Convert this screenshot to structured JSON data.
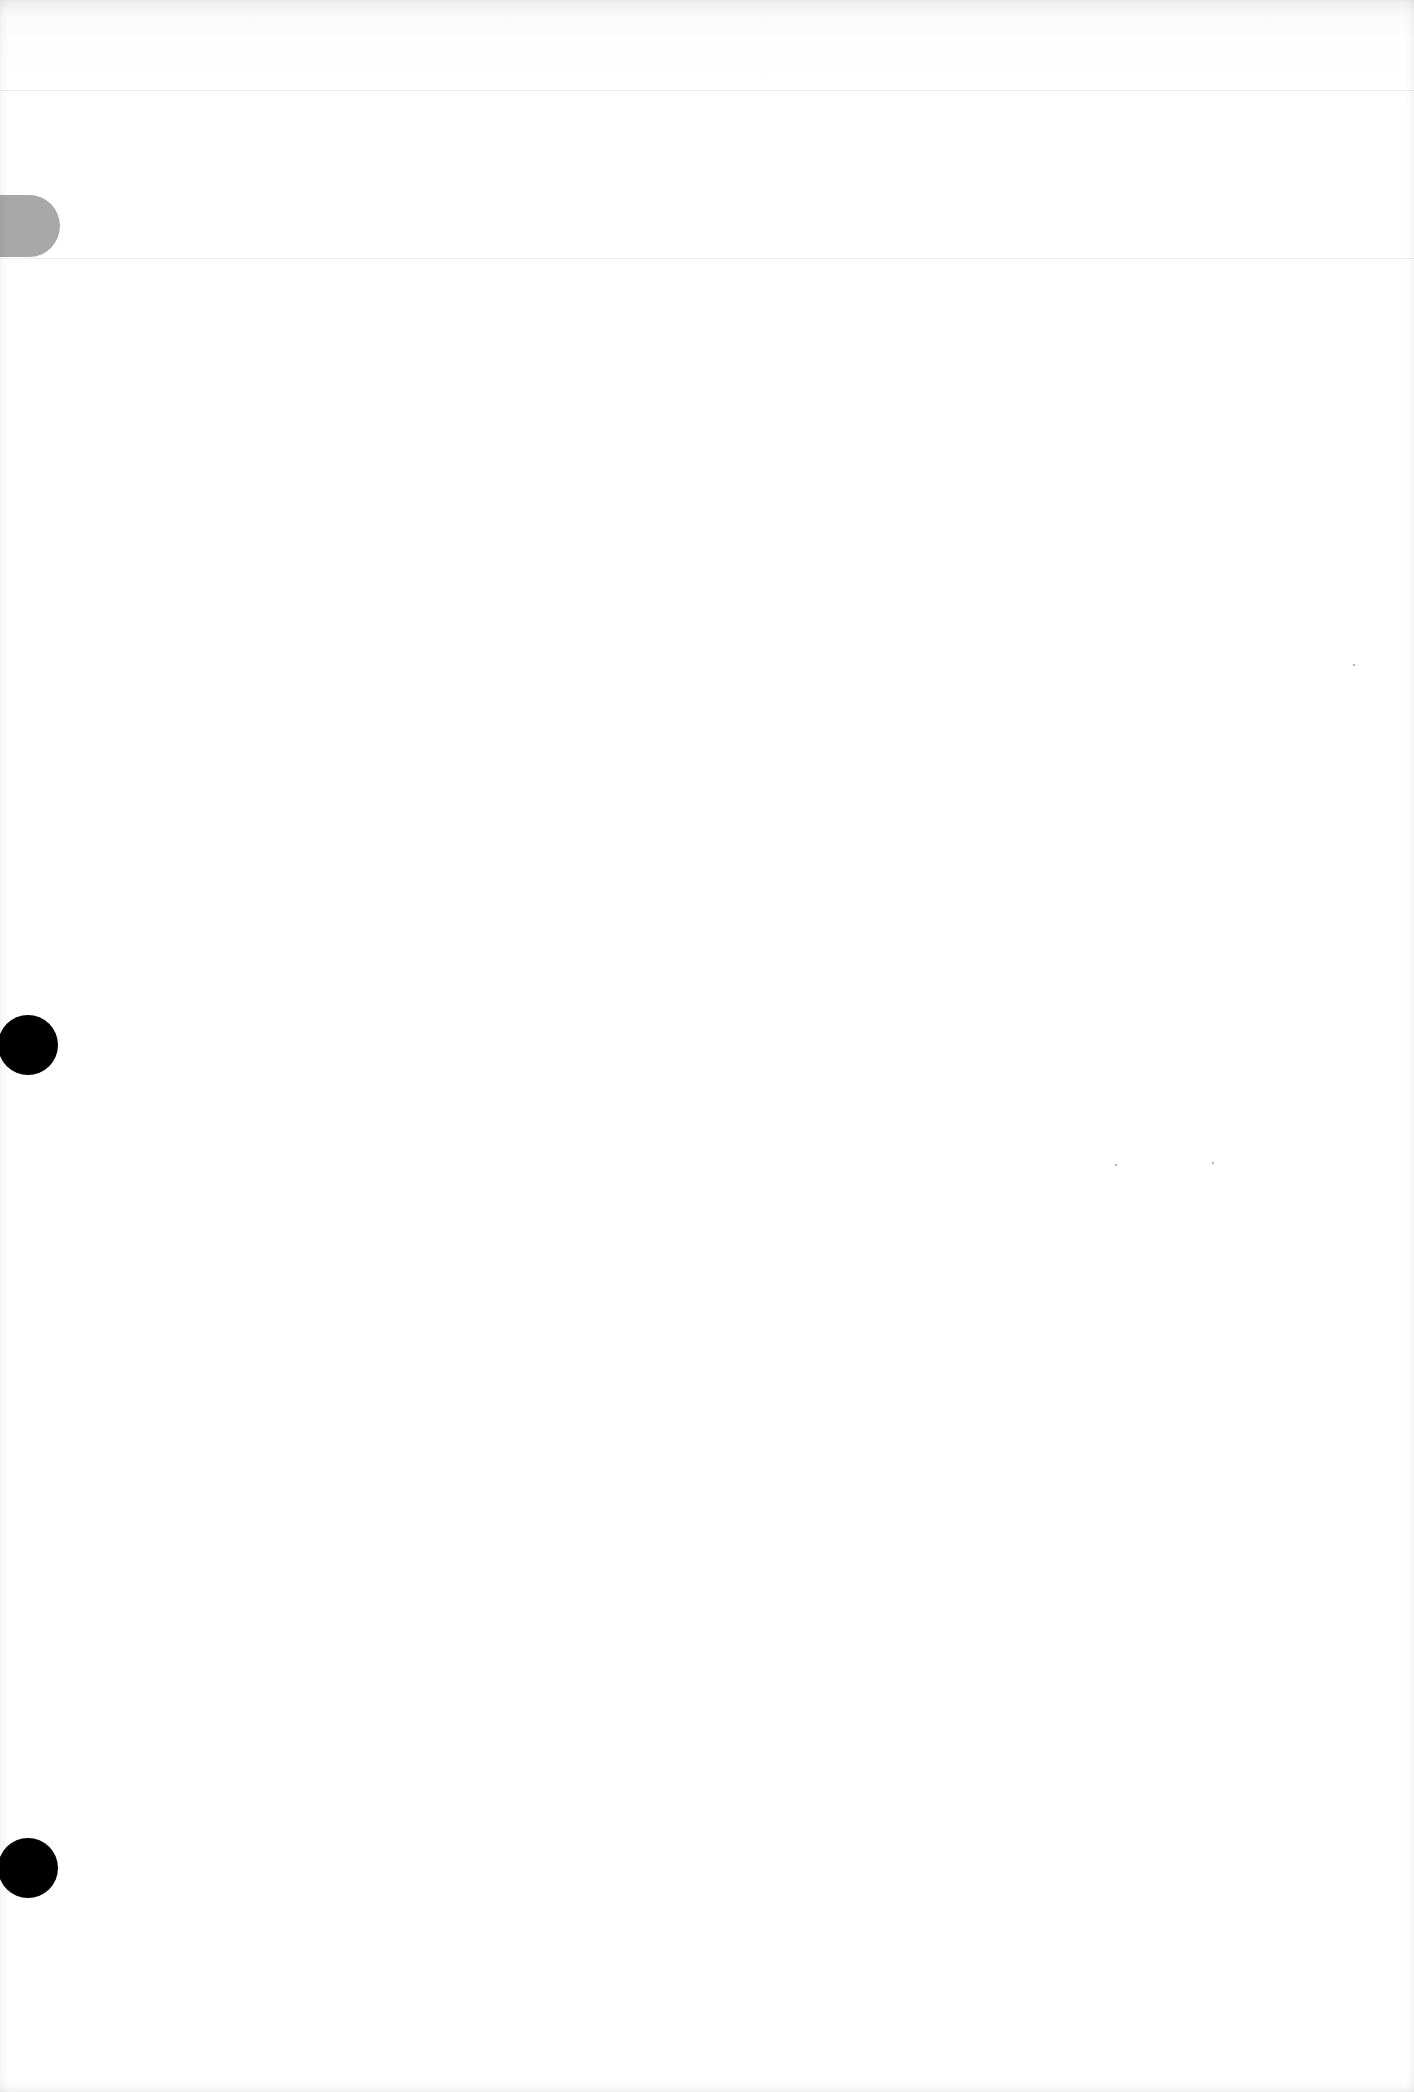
{
  "document": {
    "type": "blank scanned page",
    "text": ""
  },
  "colors": {
    "paper": "#ffffff",
    "tab": "#a8a8a8",
    "punch_hole": "#000000",
    "rule_line": "#eeeeee"
  },
  "punch_holes": [
    {
      "label": "punch-hole-upper",
      "center_y": 1045
    },
    {
      "label": "punch-hole-lower",
      "center_y": 1868
    }
  ]
}
